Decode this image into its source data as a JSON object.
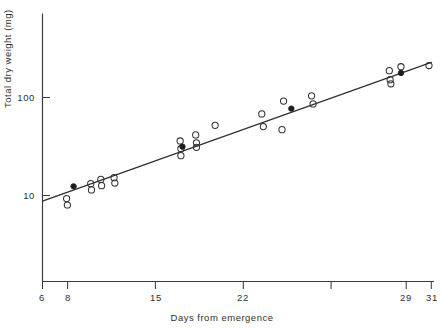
{
  "chart_data": {
    "type": "scatter",
    "title": "",
    "xlabel": "Days from emergence",
    "ylabel": "Total dry weight (mg)",
    "yscale": "log",
    "xlim": [
      6,
      31
    ],
    "ylim": [
      5.2,
      330
    ],
    "grid": false,
    "legend_position": "none",
    "xticks": [
      6,
      8,
      15,
      22,
      29,
      31
    ],
    "xticklabels": [
      "6",
      "8",
      "15",
      "22",
      "29",
      "31"
    ],
    "yticks": [
      10,
      100
    ],
    "yticklabels": [
      "10",
      "100"
    ],
    "series": [
      {
        "name": "individual observations",
        "marker": "open-circle",
        "points": [
          {
            "x": 7.55,
            "y": 9.3
          },
          {
            "x": 7.6,
            "y": 8.0
          },
          {
            "x": 9.1,
            "y": 13.2
          },
          {
            "x": 9.15,
            "y": 11.4
          },
          {
            "x": 9.75,
            "y": 14.6
          },
          {
            "x": 9.8,
            "y": 12.6
          },
          {
            "x": 10.6,
            "y": 15.2
          },
          {
            "x": 10.65,
            "y": 13.4
          },
          {
            "x": 14.85,
            "y": 36.0
          },
          {
            "x": 14.9,
            "y": 30.0
          },
          {
            "x": 14.9,
            "y": 25.5
          },
          {
            "x": 15.85,
            "y": 41.5
          },
          {
            "x": 15.9,
            "y": 34.5
          },
          {
            "x": 15.9,
            "y": 31.0
          },
          {
            "x": 17.1,
            "y": 52.0
          },
          {
            "x": 20.1,
            "y": 68.0
          },
          {
            "x": 20.2,
            "y": 50.5
          },
          {
            "x": 21.4,
            "y": 47.0
          },
          {
            "x": 21.5,
            "y": 92.0
          },
          {
            "x": 23.3,
            "y": 104.0
          },
          {
            "x": 23.4,
            "y": 86.0
          },
          {
            "x": 28.3,
            "y": 188.0
          },
          {
            "x": 28.35,
            "y": 152.0
          },
          {
            "x": 28.4,
            "y": 138.0
          },
          {
            "x": 29.05,
            "y": 206.0
          },
          {
            "x": 30.85,
            "y": 212.0
          }
        ]
      },
      {
        "name": "group means",
        "marker": "filled-circle",
        "points": [
          {
            "x": 8.0,
            "y": 12.4
          },
          {
            "x": 15.0,
            "y": 31.5
          },
          {
            "x": 22.0,
            "y": 77.0
          },
          {
            "x": 29.05,
            "y": 178.0
          }
        ]
      }
    ],
    "fit_line": {
      "name": "regression line",
      "x_start": 6.0,
      "y_start": 8.75,
      "x_end": 31.0,
      "y_end": 228.0
    },
    "annotations": []
  },
  "caption": {
    "text": ""
  }
}
